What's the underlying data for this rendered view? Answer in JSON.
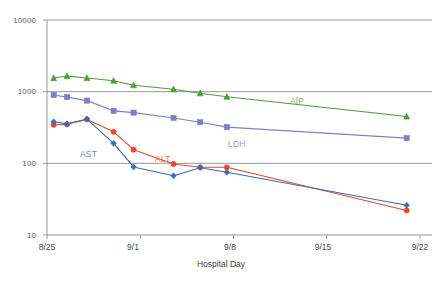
{
  "chart_data": {
    "type": "line",
    "title": "",
    "subtitle": "",
    "xlabel": "Hospital Day",
    "ylabel": "",
    "yscale": "log",
    "ylim": [
      10,
      10000
    ],
    "ytick_labels": [
      "10000",
      "1000",
      "100",
      "10"
    ],
    "ytick_values": [
      10000,
      1000,
      100,
      10
    ],
    "xtick_labels": [
      "8/25",
      "9/1",
      "9/8",
      "9/15",
      "9/22"
    ],
    "xtick_values": [
      0,
      7,
      14,
      21,
      28
    ],
    "grid": "horizontal-major",
    "legend_position": "inline-annotations",
    "x_days": [
      0.5,
      1.5,
      3.0,
      5.0,
      6.5,
      9.5,
      11.5,
      13.5,
      27.0
    ],
    "series": [
      {
        "name": "AlP",
        "label": "AlP",
        "color": "#4f9b3f",
        "marker": "triangle",
        "values": [
          1550,
          1650,
          1550,
          1420,
          1230,
          1080,
          950,
          850,
          450
        ],
        "label_x": 290,
        "label_y": 96
      },
      {
        "name": "LDH",
        "label": "LDH",
        "color": "#7b80c6",
        "marker": "square",
        "values": [
          900,
          840,
          750,
          540,
          510,
          430,
          375,
          320,
          225
        ],
        "label_x": 228,
        "label_y": 139
      },
      {
        "name": "ALT",
        "label": "ALT",
        "color": "#e8482c",
        "marker": "circle",
        "values": [
          345,
          350,
          410,
          275,
          155,
          98,
          88,
          88,
          22
        ],
        "label_x": 155,
        "label_y": 154
      },
      {
        "name": "AST",
        "label": "AST",
        "color": "#3a6cb4",
        "marker": "diamond",
        "values": [
          380,
          355,
          415,
          190,
          89,
          67,
          87,
          75,
          26
        ],
        "label_x": 80,
        "label_y": 149
      }
    ],
    "axis_color": "#8c8c8c",
    "grid_color": "#8c8c8c",
    "background": "#ffffff"
  }
}
